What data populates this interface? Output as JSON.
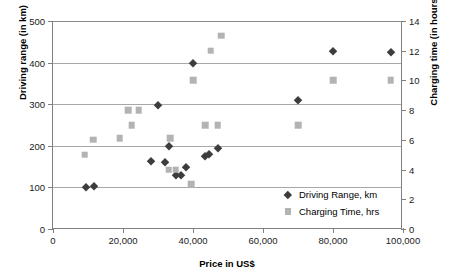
{
  "chart_data": {
    "type": "scatter",
    "title": "",
    "xlabel": "Price in US$",
    "ylabel": "Driving range (in km)",
    "y2label": "Charging time (in hours)",
    "xlim": [
      0,
      100000
    ],
    "ylim": [
      0,
      500
    ],
    "y2lim": [
      0,
      14
    ],
    "grid": true,
    "legend_position": "lower-right-inside",
    "xticks": [
      0,
      20000,
      40000,
      60000,
      80000,
      100000
    ],
    "xticklabels": [
      "0",
      "20,000",
      "40,000",
      "60,000",
      "80,000",
      "100,000"
    ],
    "yticks": [
      0,
      100,
      200,
      300,
      400,
      500
    ],
    "yticklabels": [
      "0",
      "100",
      "200",
      "300",
      "400",
      "500"
    ],
    "y2ticks": [
      0,
      2,
      4,
      6,
      8,
      10,
      12,
      14
    ],
    "y2ticklabels": [
      "0",
      "2",
      "4",
      "6",
      "8",
      "10",
      "12",
      "14"
    ],
    "series": [
      {
        "name": "Driving Range, km",
        "marker": "diamond",
        "color": "#3d3d3d",
        "axis": "left",
        "points": [
          {
            "x": 9500,
            "y": 100
          },
          {
            "x": 11800,
            "y": 104
          },
          {
            "x": 28000,
            "y": 164
          },
          {
            "x": 30000,
            "y": 299
          },
          {
            "x": 32000,
            "y": 160
          },
          {
            "x": 33000,
            "y": 199
          },
          {
            "x": 35000,
            "y": 131
          },
          {
            "x": 36500,
            "y": 129
          },
          {
            "x": 38000,
            "y": 148
          },
          {
            "x": 40000,
            "y": 399
          },
          {
            "x": 43500,
            "y": 175
          },
          {
            "x": 44500,
            "y": 180
          },
          {
            "x": 47000,
            "y": 194
          },
          {
            "x": 70000,
            "y": 309
          },
          {
            "x": 80000,
            "y": 428
          },
          {
            "x": 96500,
            "y": 425
          }
        ]
      },
      {
        "name": "Charging Time, hrs",
        "marker": "square",
        "color": "#b3b3b3",
        "axis": "right",
        "points": [
          {
            "x": 9000,
            "y": 5.0
          },
          {
            "x": 11500,
            "y": 6.0
          },
          {
            "x": 19000,
            "y": 6.1
          },
          {
            "x": 21500,
            "y": 8.0
          },
          {
            "x": 22500,
            "y": 7.0
          },
          {
            "x": 24500,
            "y": 8.0
          },
          {
            "x": 33000,
            "y": 4.0
          },
          {
            "x": 33500,
            "y": 6.1
          },
          {
            "x": 35000,
            "y": 4.0
          },
          {
            "x": 39500,
            "y": 3.0
          },
          {
            "x": 40000,
            "y": 10.0
          },
          {
            "x": 43500,
            "y": 7.0
          },
          {
            "x": 45000,
            "y": 12.0
          },
          {
            "x": 47000,
            "y": 7.0
          },
          {
            "x": 48000,
            "y": 13.0
          },
          {
            "x": 70000,
            "y": 7.0
          },
          {
            "x": 80000,
            "y": 10.0
          },
          {
            "x": 96500,
            "y": 10.0
          }
        ]
      }
    ]
  }
}
